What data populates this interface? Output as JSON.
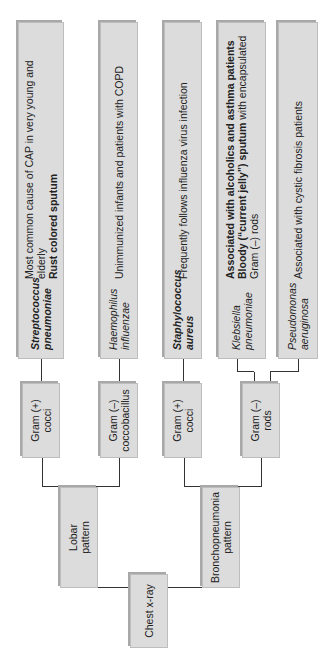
{
  "root": {
    "label": "Chest x-ray"
  },
  "patterns": [
    {
      "label": "Lobar\npattern"
    },
    {
      "label": "Bronchopneumonia\npattern"
    }
  ],
  "gram": [
    {
      "label": "Gram (+)\ncocci"
    },
    {
      "label": "Gram (–)\ncoccobacillus"
    },
    {
      "label": "Gram (+)\ncocci"
    },
    {
      "label": "Gram (–)\nrods"
    }
  ],
  "organisms": [
    {
      "name": "Streptococcus pneumoniae",
      "desc_plain": "Most common cause of CAP in very young and elderly",
      "desc_bold": "Rust colored sputum"
    },
    {
      "name": "Haemophilus influenzae",
      "desc_plain": "Unimmunized infants and patients with COPD"
    },
    {
      "name": "Staphylococcus aureus",
      "desc_plain": "Frequently follows influenza virus infection"
    },
    {
      "name": "Klebsiella pneumoniae",
      "desc_bold1": "Associated with alcoholics and asthma patients",
      "desc_bold2": "Bloody (“current jelly”) sputum",
      "desc_plain2": " with encapsulated",
      "desc_plain3": "Gram (–) rods"
    },
    {
      "name": "Pseudomonas aeruginosa",
      "desc_plain": "Associated with cystic fibrosis patients"
    }
  ]
}
